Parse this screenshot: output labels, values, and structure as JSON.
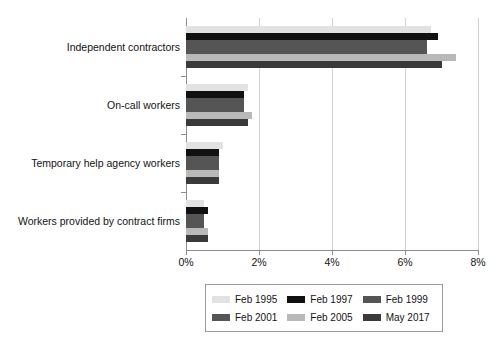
{
  "chart_data": {
    "type": "bar",
    "orientation": "horizontal",
    "title": "",
    "subtitle": "",
    "xlabel": "",
    "ylabel": "",
    "xlim": [
      0,
      8
    ],
    "xticks": [
      "0%",
      "2%",
      "4%",
      "6%",
      "8%"
    ],
    "xtick_values": [
      0,
      2,
      4,
      6,
      8
    ],
    "grid": "vertical",
    "legend_position": "bottom",
    "categories": [
      "Independent contractors",
      "On-call workers",
      "Temporary help agency workers",
      "Workers provided by contract firms"
    ],
    "series": [
      {
        "name": "Feb 1995",
        "color": "#e2e2e2",
        "values": [
          6.7,
          1.7,
          1.0,
          0.5
        ]
      },
      {
        "name": "Feb 1997",
        "color": "#111111",
        "values": [
          6.9,
          1.6,
          0.9,
          0.6
        ]
      },
      {
        "name": "Feb 1999",
        "color": "#555555",
        "values": [
          6.6,
          1.6,
          0.9,
          0.5
        ]
      },
      {
        "name": "Feb 2001",
        "color": "#555555",
        "values": [
          6.6,
          1.6,
          0.9,
          0.5
        ]
      },
      {
        "name": "Feb 2005",
        "color": "#b9b9b9",
        "values": [
          7.4,
          1.8,
          0.9,
          0.6
        ]
      },
      {
        "name": "May 2017",
        "color": "#3a3a3a",
        "values": [
          7.0,
          1.7,
          0.9,
          0.6
        ]
      }
    ]
  },
  "legend": {
    "items": [
      {
        "label": "Feb 1995",
        "color": "#e2e2e2"
      },
      {
        "label": "Feb 1997",
        "color": "#111111"
      },
      {
        "label": "Feb 1999",
        "color": "#555555"
      },
      {
        "label": "Feb 2001",
        "color": "#555555"
      },
      {
        "label": "Feb 2005",
        "color": "#b9b9b9"
      },
      {
        "label": "May 2017",
        "color": "#3a3a3a"
      }
    ]
  },
  "axis": {
    "x_tick_labels": [
      "0%",
      "2%",
      "4%",
      "6%",
      "8%"
    ],
    "y_tick_labels": [
      "Independent contractors",
      "On-call workers",
      "Temporary help agency workers",
      "Workers provided by contract firms"
    ]
  }
}
